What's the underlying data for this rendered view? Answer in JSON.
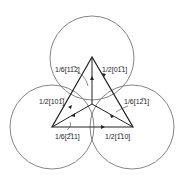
{
  "diagram": {
    "title": "",
    "vectors": [
      {
        "id": "a",
        "label": "1/6[11̅2]"
      },
      {
        "id": "b",
        "label": "1/2[01̅1]"
      },
      {
        "id": "c",
        "label": "1/2[101̅]"
      },
      {
        "id": "d",
        "label": "1/6[12̅1]"
      },
      {
        "id": "e",
        "label": "1/6[2̅11]"
      },
      {
        "id": "f",
        "label": "1/2[1̅10]"
      }
    ],
    "colors": {
      "line": "#222222",
      "circle": "#555555"
    }
  }
}
